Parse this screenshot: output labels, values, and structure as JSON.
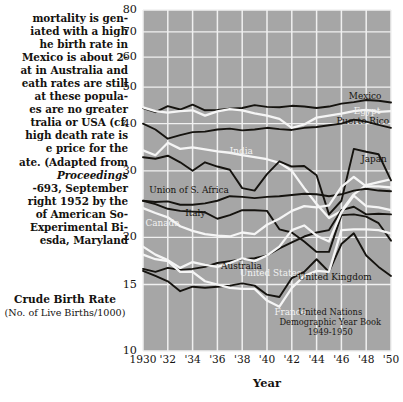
{
  "caption": {
    "lines": [
      {
        "text": "mortality is gen-",
        "italic": false
      },
      {
        "text": "iated with a high",
        "italic": false
      },
      {
        "text": "he birth rate in",
        "italic": false
      },
      {
        "text": "Mexico is about 2-",
        "italic": false
      },
      {
        "text": "at in Australia and",
        "italic": false
      },
      {
        "text": "eath rates are still",
        "italic": false
      },
      {
        "text": "at these popula-",
        "italic": false
      },
      {
        "text": "es are no greater",
        "italic": false
      },
      {
        "text": "tralia or USA (cf.",
        "italic": false
      },
      {
        "text": "high death rate is",
        "italic": false
      },
      {
        "text": "e price for the",
        "italic": false
      },
      {
        "text": "ate. (Adapted from",
        "italic": false
      },
      {
        "text": "Proceedings",
        "italic": true
      },
      {
        "text": "-693, September",
        "italic": false
      },
      {
        "text": "right 1952 by the",
        "italic": false
      },
      {
        "text": "of American So-",
        "italic": false
      },
      {
        "text": "Experimental Bi-",
        "italic": false
      },
      {
        "text": "esda, Maryland",
        "italic": false
      }
    ]
  },
  "axis_titles": {
    "y_main": "Crude Birth Rate",
    "y_sub": "(No. of Live Births/1000)",
    "x": "Year"
  },
  "source_note": {
    "lines": [
      "United Nations",
      "Demographic Year Book",
      "1949-1950"
    ]
  },
  "colors": {
    "plot_background": "#a6a6a6",
    "grid": "#f0f0f0",
    "dark_series": "#15130f",
    "light_series": "#f5f5f5",
    "text": "#14120f"
  },
  "chart_data": {
    "type": "line",
    "title": "Crude Birth Rate",
    "xlabel": "Year",
    "ylabel": "Crude Birth Rate (No. of Live Births/1000)",
    "yscale": "log",
    "ylim": [
      10,
      80
    ],
    "xlim": [
      1930,
      1950
    ],
    "grid": true,
    "legend": "inline-labels",
    "yticks": [
      10,
      15,
      20,
      30,
      40,
      50,
      60,
      70,
      80
    ],
    "ytick_labels": [
      "10",
      "15",
      "20",
      "30",
      "40",
      "50",
      "60",
      "70",
      "80"
    ],
    "xticks": [
      1930,
      1932,
      1934,
      1936,
      1938,
      1940,
      1942,
      1944,
      1946,
      1948,
      1950
    ],
    "xtick_labels": [
      "1930",
      "'32",
      "'34",
      "'36",
      "'38",
      "'40",
      "'42",
      "'44",
      "'46",
      "'48",
      "'50"
    ],
    "x": [
      1930,
      1931,
      1932,
      1933,
      1934,
      1935,
      1936,
      1937,
      1938,
      1939,
      1940,
      1941,
      1942,
      1943,
      1944,
      1945,
      1946,
      1947,
      1948,
      1949,
      1950
    ],
    "series": [
      {
        "name": "Mexico",
        "color": "dark",
        "label_pos": {
          "x": 1946.6,
          "y": 47.0
        },
        "values": [
          44.0,
          42.9,
          44.5,
          43.6,
          44.9,
          43.4,
          43.5,
          43.8,
          44.0,
          44.8,
          44.3,
          44.2,
          44.6,
          44.4,
          44.0,
          44.4,
          45.2,
          45.6,
          46.2,
          46.0,
          45.5
        ]
      },
      {
        "name": "Egypt",
        "color": "light",
        "label_pos": {
          "x": 1947.0,
          "y": 43.0
        },
        "values": [
          44.2,
          43.2,
          42.8,
          43.2,
          43.4,
          42.0,
          43.1,
          43.7,
          43.4,
          42.6,
          42.0,
          41.2,
          39.0,
          39.8,
          41.5,
          42.0,
          42.5,
          43.2,
          43.5,
          43.0,
          43.2
        ]
      },
      {
        "name": "Puerto Rico",
        "color": "dark",
        "label_pos": {
          "x": 1945.6,
          "y": 40.3
        },
        "values": [
          40.0,
          38.6,
          36.5,
          37.3,
          38.0,
          38.1,
          38.6,
          38.8,
          38.4,
          38.6,
          39.0,
          38.7,
          38.5,
          39.0,
          39.2,
          39.6,
          40.0,
          41.0,
          40.5,
          39.7,
          39.0
        ]
      },
      {
        "name": "India",
        "color": "light",
        "label_pos": {
          "x": 1937.0,
          "y": 33.6
        },
        "values": [
          34.0,
          33.0,
          35.6,
          34.3,
          34.6,
          34.2,
          33.8,
          33.5,
          33.0,
          32.6,
          32.2,
          31.5,
          30.0,
          27.0,
          24.5,
          22.5,
          23.5,
          26.0,
          27.5,
          28.0,
          28.5
        ]
      },
      {
        "name": "Japan",
        "color": "dark",
        "label_pos": {
          "x": 1947.6,
          "y": 32.0
        },
        "values": [
          32.6,
          32.3,
          32.9,
          31.6,
          30.0,
          31.6,
          30.8,
          30.2,
          27.0,
          26.6,
          29.4,
          31.8,
          30.8,
          30.9,
          29.2,
          23.0,
          25.0,
          34.3,
          33.7,
          33.2,
          28.3
        ]
      },
      {
        "name": "Union of S. Africa",
        "color": "dark",
        "label_pos": {
          "x": 1930.5,
          "y": 26.6
        },
        "values": [
          25.0,
          24.8,
          24.9,
          24.4,
          24.4,
          24.6,
          25.0,
          25.7,
          25.6,
          25.4,
          25.6,
          25.7,
          25.9,
          26.1,
          26.0,
          25.7,
          26.0,
          26.6,
          26.9,
          26.6,
          26.5
        ]
      },
      {
        "name": "Italy",
        "color": "dark",
        "label_pos": {
          "x": 1933.4,
          "y": 23.0
        },
        "values": [
          25.0,
          24.5,
          23.8,
          23.5,
          23.4,
          23.3,
          22.4,
          22.9,
          23.6,
          23.6,
          23.5,
          21.0,
          20.6,
          19.5,
          18.3,
          18.3,
          22.9,
          23.0,
          22.7,
          21.8,
          19.6
        ]
      },
      {
        "name": "Canada",
        "color": "light",
        "label_pos": {
          "x": 1930.2,
          "y": 21.7
        },
        "values": [
          23.9,
          23.2,
          22.6,
          21.4,
          20.8,
          20.4,
          20.2,
          20.1,
          20.6,
          20.4,
          21.6,
          22.4,
          23.5,
          24.2,
          24.0,
          24.3,
          27.2,
          28.9,
          27.3,
          27.3,
          27.1
        ]
      },
      {
        "name": "Australia",
        "color": "dark",
        "label_pos": {
          "x": 1936.3,
          "y": 16.7
        },
        "values": [
          16.5,
          16.2,
          16.6,
          16.4,
          16.5,
          16.7,
          17.1,
          17.3,
          17.5,
          17.6,
          17.9,
          18.7,
          19.4,
          20.1,
          20.6,
          20.9,
          23.6,
          24.1,
          23.0,
          23.1,
          23.0
        ]
      },
      {
        "name": "United States",
        "color": "light",
        "label_pos": {
          "x": 1937.8,
          "y": 16.0
        },
        "values": [
          18.9,
          18.0,
          17.4,
          16.6,
          17.2,
          16.9,
          16.7,
          17.1,
          17.6,
          17.3,
          17.9,
          18.9,
          20.9,
          21.5,
          20.2,
          19.5,
          23.3,
          25.8,
          24.2,
          24.0,
          23.6
        ]
      },
      {
        "name": "United Kingdom",
        "color": "dark",
        "label_pos": {
          "x": 1942.5,
          "y": 15.6
        },
        "values": [
          16.3,
          15.8,
          15.3,
          14.4,
          14.8,
          14.7,
          14.8,
          14.9,
          15.1,
          14.9,
          14.1,
          13.9,
          15.6,
          16.2,
          17.5,
          16.2,
          19.2,
          20.5,
          17.9,
          16.7,
          15.8
        ]
      },
      {
        "name": "France",
        "color": "light",
        "label_pos": {
          "x": 1940.6,
          "y": 12.6
        },
        "values": [
          18.0,
          17.5,
          17.3,
          16.2,
          16.2,
          15.3,
          15.0,
          14.7,
          14.6,
          14.6,
          13.6,
          13.1,
          14.7,
          15.8,
          16.3,
          16.2,
          20.9,
          21.0,
          21.0,
          20.9,
          20.5
        ]
      }
    ]
  }
}
